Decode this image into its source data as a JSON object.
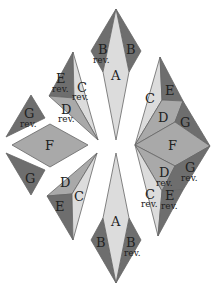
{
  "colors": {
    "dark": "#6e6e6e",
    "mid": "#a9a9a9",
    "light": "#dcdcdc",
    "background": "#ffffff"
  },
  "labels": {
    "A": "A",
    "B": "B",
    "C": "C",
    "D": "D",
    "E": "E",
    "F": "F",
    "G": "G",
    "rev": "rev."
  },
  "pieces": [
    {
      "name": "top-spike",
      "faces": [
        "B rev.",
        "A",
        "B"
      ]
    },
    {
      "name": "upper-left-wedge",
      "faces": [
        "E rev.",
        "C rev.",
        "D rev."
      ]
    },
    {
      "name": "left-small-top",
      "faces": [
        "G rev."
      ]
    },
    {
      "name": "left-diamond",
      "faces": [
        "F"
      ]
    },
    {
      "name": "left-small-bottom",
      "faces": [
        "G"
      ]
    },
    {
      "name": "lower-left-wedge",
      "faces": [
        "D",
        "E",
        "C"
      ]
    },
    {
      "name": "bottom-spike",
      "faces": [
        "A",
        "B",
        "B rev."
      ]
    },
    {
      "name": "right-assembly",
      "faces": [
        "C",
        "E",
        "D",
        "G",
        "F",
        "D rev.",
        "G rev.",
        "C rev.",
        "E rev."
      ]
    }
  ]
}
